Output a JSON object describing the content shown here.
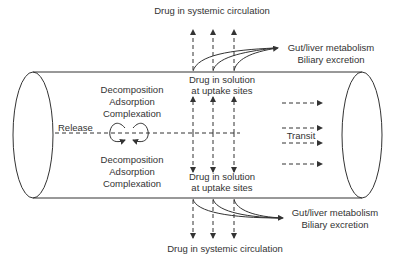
{
  "diagram": {
    "labels": {
      "systemic_top": "Drug in systemic circulation",
      "systemic_bottom": "Drug in systemic circulation",
      "metabolism_top_line1": "Gut/liver metabolism",
      "metabolism_top_line2": "Biliary excretion",
      "metabolism_bottom_line1": "Gut/liver metabolism",
      "metabolism_bottom_line2": "Biliary excretion",
      "solution_top_line1": "Drug in solution",
      "solution_top_line2": "at uptake sites",
      "solution_bottom_line1": "Drug in solution",
      "solution_bottom_line2": "at uptake sites",
      "processes_top": [
        "Decomposition",
        "Adsorption",
        "Complexation"
      ],
      "processes_bottom": [
        "Decomposition",
        "Adsorption",
        "Complexation"
      ],
      "release": "Release",
      "transit": "Transit"
    },
    "colors": {
      "line": "#333333",
      "background": "#ffffff"
    }
  }
}
